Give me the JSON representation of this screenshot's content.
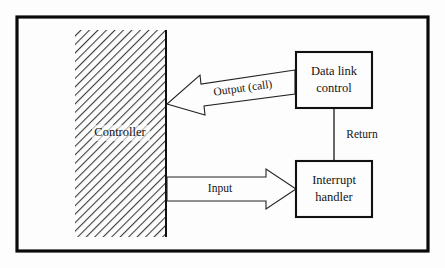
{
  "figure": {
    "kind": "block-diagram",
    "title_visible": false,
    "background_color": "#fdfdfd",
    "frame": {
      "name": "outer-border",
      "color": "#0a0a0a",
      "x": 17,
      "y": 17,
      "width": 411,
      "height": 234,
      "stroke_width": 3.2
    }
  },
  "regions": [
    {
      "id": "controller",
      "label": "Controller",
      "fill": "diagonal-hatch",
      "hatch_color": "#3a3a3a",
      "x": 75,
      "y": 30,
      "width": 91,
      "height": 207,
      "label_x": 120,
      "label_y": 133
    }
  ],
  "boxes": [
    {
      "id": "data-link-control",
      "lines": [
        "Data link",
        "control"
      ],
      "x": 296,
      "y": 52,
      "width": 76,
      "height": 56,
      "border_color": "#111111",
      "fill": "#fdfdfd"
    },
    {
      "id": "interrupt-handler",
      "lines": [
        "Interrupt",
        "handler"
      ],
      "x": 296,
      "y": 161,
      "width": 76,
      "height": 56,
      "border_color": "#111111",
      "fill": "#fdfdfd"
    }
  ],
  "connectors": [
    {
      "id": "output-call",
      "label": "Output (call)",
      "style": "block-arrow",
      "direction": "right-to-left",
      "from": "data-link-control",
      "to": "controller",
      "label_rotation_deg": -8,
      "label_x": 243,
      "label_y": 89
    },
    {
      "id": "input",
      "label": "Input",
      "style": "block-arrow",
      "direction": "left-to-right",
      "from": "controller",
      "to": "interrupt-handler",
      "label_rotation_deg": 0,
      "label_x": 220,
      "label_y": 189
    },
    {
      "id": "return",
      "label": "Return",
      "style": "plain-line",
      "direction": "top-to-bottom",
      "from": "data-link-control",
      "to": "interrupt-handler",
      "label_rotation_deg": 0,
      "label_x": 362,
      "label_y": 135
    }
  ]
}
